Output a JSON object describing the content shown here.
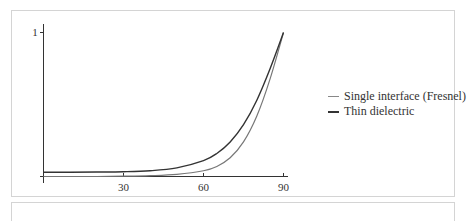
{
  "chart_data": {
    "type": "line",
    "title": "",
    "xlabel": "",
    "ylabel": "",
    "xlim": [
      0,
      90
    ],
    "ylim": [
      0,
      1
    ],
    "x_ticks": [
      "30",
      "60",
      "90"
    ],
    "y_ticks": [
      "1"
    ],
    "grid": false,
    "legend_position": "right",
    "series": [
      {
        "name": "Single interface (Fresnel)",
        "color": "#777777",
        "x": [
          0,
          10,
          20,
          30,
          40,
          50,
          60,
          65,
          70,
          75,
          80,
          85,
          90
        ],
        "y": [
          0.0,
          0.0,
          0.0,
          0.002,
          0.006,
          0.015,
          0.04,
          0.07,
          0.13,
          0.24,
          0.42,
          0.68,
          1.0
        ]
      },
      {
        "name": "Thin dielectric",
        "color": "#333333",
        "x": [
          0,
          10,
          20,
          30,
          40,
          50,
          60,
          65,
          70,
          75,
          80,
          85,
          90
        ],
        "y": [
          0.03,
          0.03,
          0.031,
          0.033,
          0.04,
          0.06,
          0.11,
          0.16,
          0.24,
          0.36,
          0.53,
          0.75,
          1.0
        ]
      }
    ]
  },
  "legend": {
    "items": [
      {
        "label": "Single interface (Fresnel)",
        "color": "#888888"
      },
      {
        "label": "Thin dielectric",
        "color": "#333333"
      }
    ]
  },
  "axes": {
    "y_tick_label": "1",
    "x_tick_labels": [
      "30",
      "60",
      "90"
    ]
  }
}
